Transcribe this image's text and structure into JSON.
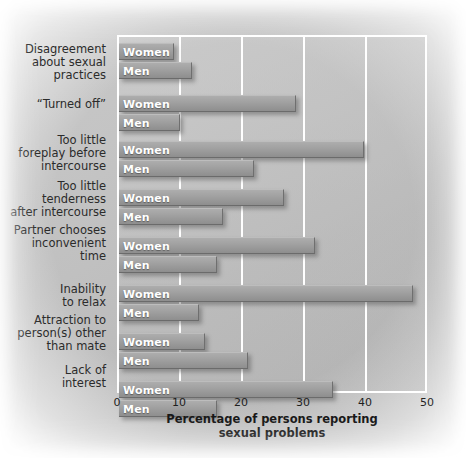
{
  "chart_data": {
    "type": "bar",
    "orientation": "horizontal",
    "title": "",
    "xlabel": "Percentage of persons reporting sexual problems",
    "ylabel": "",
    "xlim": [
      0,
      50
    ],
    "xticks": [
      0,
      10,
      20,
      30,
      40,
      50
    ],
    "grid": "vertical-white",
    "legend": "inline-bar-labels",
    "series_names": [
      "Women",
      "Men"
    ],
    "categories": [
      "Disagreement\nabout sexual\npractices",
      "“Turned off”",
      "Too little\nforeplay before\nintercourse",
      "Too little\ntenderness\nafter intercourse",
      "Partner chooses\ninconvenient\ntime",
      "Inability\nto relax",
      "Attraction to\nperson(s) other\nthan mate",
      "Lack of\ninterest"
    ],
    "series": [
      {
        "name": "Women",
        "values": [
          9,
          29,
          40,
          27,
          32,
          48,
          14,
          35
        ]
      },
      {
        "name": "Men",
        "values": [
          12,
          10,
          22,
          17,
          16,
          13,
          21,
          16
        ]
      }
    ],
    "bar_labels": [
      "Women",
      "Men"
    ],
    "colors": {
      "bar": "#9a9a9a",
      "bar_label_text": "#ffffff",
      "gridline": "#ffffff",
      "panel_background": "#bfbfbf",
      "axis_text": "#1f1f1f"
    }
  },
  "axis": {
    "tick_labels": [
      "0",
      "10",
      "20",
      "30",
      "40",
      "50"
    ],
    "x_title_line1": "Percentage of persons reporting",
    "x_title_line2": "sexual problems"
  }
}
